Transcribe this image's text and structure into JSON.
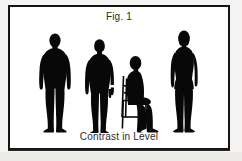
{
  "figure": {
    "title": "Fig. 1",
    "caption": "Contrast in Level",
    "frame_color": "#151515",
    "background_color": "#ffffff",
    "page_color": "#f4f3f1",
    "silhouette_color": "#080808",
    "figures": [
      {
        "id": "figure-1",
        "name": "standing-male-front",
        "pose": "standing",
        "orientation": "front",
        "level": "standing",
        "relative_height": 100
      },
      {
        "id": "figure-2",
        "name": "standing-male-front-shorter",
        "pose": "standing",
        "orientation": "front",
        "level": "standing",
        "relative_height": 93
      },
      {
        "id": "figure-3",
        "name": "seated-figure-on-chair",
        "pose": "seated",
        "orientation": "profile",
        "level": "seated",
        "relative_height": 68,
        "prop": "chair"
      },
      {
        "id": "figure-4",
        "name": "standing-female-front",
        "pose": "standing",
        "orientation": "front",
        "level": "standing",
        "relative_height": 103
      }
    ]
  }
}
